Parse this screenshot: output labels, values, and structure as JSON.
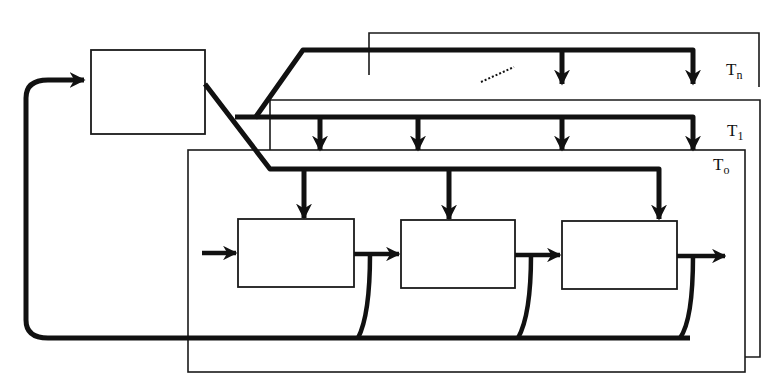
{
  "diagram": {
    "title": "",
    "layers": [
      {
        "id": "Tn",
        "label_main": "T",
        "label_sub": "n"
      },
      {
        "id": "T1",
        "label_main": "T",
        "label_sub": "1"
      },
      {
        "id": "T0",
        "label_main": "T",
        "label_sub": "o"
      }
    ],
    "controller_block": {
      "label": ""
    },
    "pipeline_blocks": [
      {
        "label": ""
      },
      {
        "label": ""
      },
      {
        "label": ""
      }
    ],
    "ellipsis_indicator": "dotted"
  },
  "colors": {
    "stroke": "#111111",
    "background": "#ffffff"
  }
}
